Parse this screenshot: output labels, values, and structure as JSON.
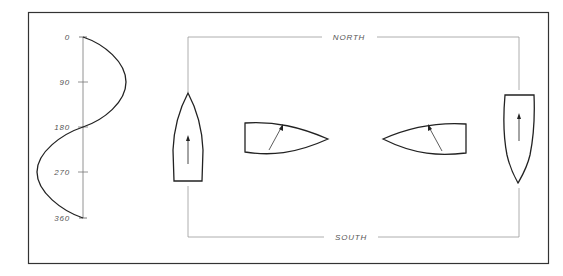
{
  "diagram": {
    "type": "sailing-course-heading-diagram",
    "colors": {
      "line": "#222222",
      "thin_line": "#888888",
      "label": "#555555",
      "background": "#ffffff"
    },
    "heading_axis": {
      "ticks": [
        {
          "label": "0",
          "value": 0
        },
        {
          "label": "90",
          "value": 90
        },
        {
          "label": "180",
          "value": 180
        },
        {
          "label": "270",
          "value": 270
        },
        {
          "label": "360",
          "value": 360
        }
      ],
      "curve": "sine wave of heading vs. time, peaking right at 90 and left at 270"
    },
    "course": {
      "north_label": "NORTH",
      "south_label": "SOUTH"
    },
    "boats": [
      {
        "id": "boat-1",
        "heading": "north",
        "position": "left leg",
        "arrow": "up"
      },
      {
        "id": "boat-2",
        "heading": "east",
        "position": "top-left",
        "arrow": "up-right"
      },
      {
        "id": "boat-3",
        "heading": "west",
        "position": "top-right",
        "arrow": "up-left"
      },
      {
        "id": "boat-4",
        "heading": "south",
        "position": "right leg",
        "arrow": "up"
      }
    ]
  }
}
